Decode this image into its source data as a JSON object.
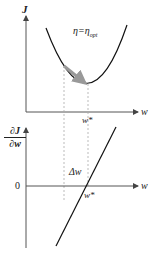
{
  "top_plot": {
    "y_axis_label": "J",
    "x_axis_label": "w",
    "annotation_eta": "η=η",
    "annotation_eta_sub": "opt",
    "minimum_label": "w*",
    "curve": "parabola",
    "arrow_color": "#999999",
    "curve_color": "#111111"
  },
  "bottom_plot": {
    "y_axis_label_num": "∂J",
    "y_axis_label_den": "∂w",
    "x_axis_label": "w",
    "zero_label": "0",
    "delta_label": "Δw",
    "root_label": "w*",
    "curve": "straight line (linear gradient)"
  },
  "colors": {
    "axis": "#555555",
    "dashed_guides": "#aaaaaa",
    "background": "#ffffff"
  }
}
